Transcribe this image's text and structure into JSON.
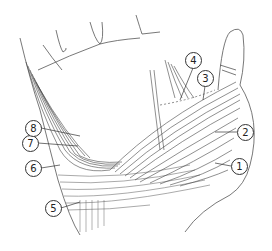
{
  "figure": {
    "style": "monochrome line drawing",
    "line_color": "#333333",
    "background": "#ffffff"
  },
  "labels": [
    {
      "id": "1",
      "text": "1",
      "x": 231,
      "y": 158
    },
    {
      "id": "2",
      "text": "2",
      "x": 237,
      "y": 124
    },
    {
      "id": "3",
      "text": "3",
      "x": 197,
      "y": 70
    },
    {
      "id": "4",
      "text": "4",
      "x": 185,
      "y": 52
    },
    {
      "id": "5",
      "text": "5",
      "x": 45,
      "y": 200
    },
    {
      "id": "6",
      "text": "6",
      "x": 25,
      "y": 160
    },
    {
      "id": "7",
      "text": "7",
      "x": 22,
      "y": 135
    },
    {
      "id": "8",
      "text": "8",
      "x": 25,
      "y": 120
    }
  ]
}
